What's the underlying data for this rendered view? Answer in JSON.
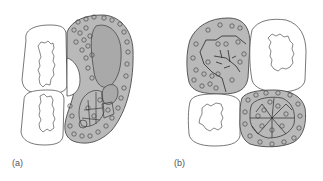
{
  "panels": [
    {
      "id": "a",
      "label": "(a)"
    },
    {
      "id": "b",
      "label": "(b)"
    }
  ],
  "colors": {
    "fill": "#b9b9b9",
    "inner_fill": "#a9a9a9",
    "stroke": "#4a4a4a",
    "light_cell": "#ffffff"
  }
}
